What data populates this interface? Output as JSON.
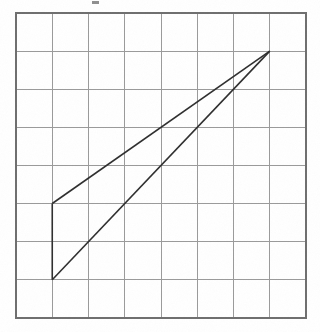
{
  "figure": {
    "background_color": "#ffffff",
    "grid": {
      "columns": 8,
      "rows": 8,
      "origin_x": 16,
      "origin_y": 13,
      "cell_width": 36.25,
      "cell_height": 38.1,
      "line_color": "#9a9a9a",
      "border_color": "#6e6e6e",
      "line_width": 1,
      "border_width": 1.4,
      "visible": true
    },
    "shape": {
      "name": "triangle",
      "stroke_color": "#2e2e2e",
      "stroke_width": 1.6,
      "fill": "none",
      "vertices": [
        {
          "label": "apex",
          "grid_x": 7,
          "grid_y": 1
        },
        {
          "label": "upper-left",
          "grid_x": 1,
          "grid_y": 5
        },
        {
          "label": "lower-left",
          "grid_x": 1,
          "grid_y": 7
        }
      ],
      "edges": [
        {
          "name": "left-vertical-edge",
          "from": "upper-left",
          "to": "lower-left"
        },
        {
          "name": "upper-diagonal-edge",
          "from": "upper-left",
          "to": "apex"
        },
        {
          "name": "lower-diagonal-edge",
          "from": "lower-left",
          "to": "apex"
        }
      ]
    },
    "artifact": {
      "name": "scan-mark",
      "x": 92,
      "y": 1,
      "width": 7,
      "height": 3,
      "color": "#6a6a6a"
    }
  },
  "chart_data": {
    "type": "scatter",
    "xlabel": "",
    "ylabel": "",
    "xlim": [
      0,
      8
    ],
    "ylim": [
      0,
      8
    ],
    "grid": true,
    "legend": "none",
    "categories": [
      "apex",
      "upper-left",
      "lower-left"
    ],
    "series": [
      {
        "name": "triangle-vertices",
        "x": [
          7,
          1,
          1
        ],
        "y": [
          1,
          5,
          7
        ]
      }
    ],
    "annotations": [
      "Left side is vertical, 2 grid units tall, on vertical gridline x=1",
      "Both diagonal edges converge at apex (7,1)",
      "Grid is 8 columns by 8 rows of equal squares"
    ]
  }
}
